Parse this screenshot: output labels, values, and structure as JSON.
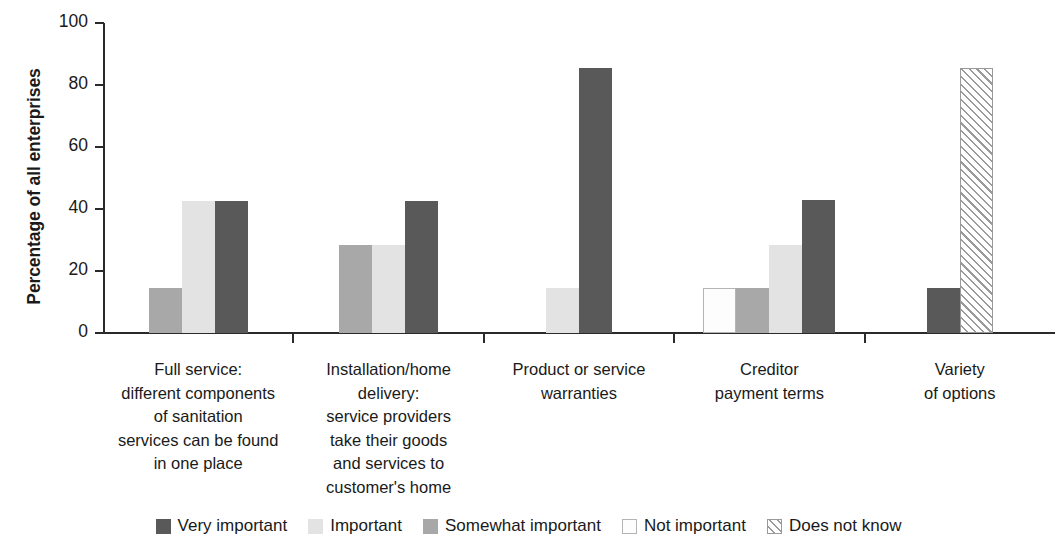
{
  "chart_data": {
    "type": "bar",
    "title": "",
    "subtitle": "",
    "xlabel": "",
    "ylabel": "Percentage of all enterprises",
    "ylim": [
      0,
      100
    ],
    "yticks": [
      0,
      20,
      40,
      60,
      80,
      100
    ],
    "grid": false,
    "legend_position": "bottom",
    "categories": [
      "Full service:\ndifferent components\nof sanitation\nservices can be found\nin one place",
      "Installation/home\ndelivery:\nservice providers\ntake their goods\nand services to\ncustomer's home",
      "Product or service\nwarranties",
      "Creditor\npayment terms",
      "Variety\nof options"
    ],
    "category_lines": [
      [
        "Full service:",
        "different components",
        "of sanitation",
        "services can be found",
        "in one place"
      ],
      [
        "Installation/home",
        "delivery:",
        "service providers",
        "take their goods",
        "and services to",
        "customer's home"
      ],
      [
        "Product or service",
        "warranties"
      ],
      [
        "Creditor",
        "payment terms"
      ],
      [
        "Variety",
        "of options"
      ]
    ],
    "series": [
      {
        "name": "Very important",
        "key": "very",
        "color": "#595959",
        "pattern": "solid",
        "values": [
          42.5,
          42.5,
          85.5,
          43.0,
          14.5
        ]
      },
      {
        "name": "Important",
        "key": "imp",
        "color": "#e3e3e3",
        "pattern": "solid",
        "values": [
          42.5,
          28.5,
          14.5,
          28.5,
          null
        ]
      },
      {
        "name": "Somewhat important",
        "key": "some",
        "color": "#a8a8a8",
        "pattern": "solid",
        "values": [
          14.5,
          28.5,
          null,
          14.5,
          null
        ]
      },
      {
        "name": "Not important",
        "key": "not",
        "color": "#fdfdfd",
        "pattern": "outline",
        "values": [
          null,
          null,
          null,
          14.5,
          null
        ]
      },
      {
        "name": "Does not know",
        "key": "dnk",
        "color": "#ffffff",
        "pattern": "diagonal-hatch",
        "values": [
          null,
          null,
          null,
          null,
          85.5
        ]
      }
    ]
  },
  "legend": {
    "items": [
      {
        "label": "Very important",
        "swatch": "swatch-very-important"
      },
      {
        "label": "Important",
        "swatch": "swatch-important"
      },
      {
        "label": "Somewhat important",
        "swatch": "swatch-somewhat-important"
      },
      {
        "label": "Not important",
        "swatch": "swatch-not-important"
      },
      {
        "label": "Does not know",
        "swatch": "swatch-does-not-know"
      }
    ]
  },
  "axis": {
    "y_title": "Percentage of all enterprises",
    "y_tick_labels": [
      "100",
      "80",
      "60",
      "40",
      "20",
      "0"
    ]
  },
  "colors": {
    "very_important": "#595959",
    "important": "#e3e3e3",
    "somewhat_important": "#a8a8a8",
    "not_important": "#fdfdfd",
    "does_not_know": "#ffffff",
    "axis": "#2a2a2a",
    "text": "#1a1a1a",
    "background": "#ffffff"
  }
}
